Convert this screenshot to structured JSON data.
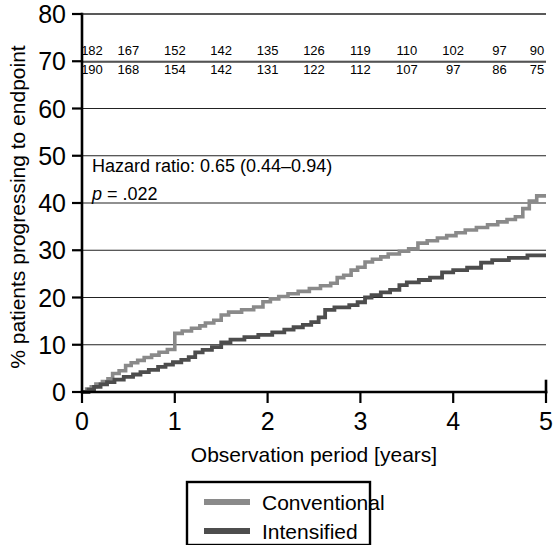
{
  "chart_data": {
    "type": "line",
    "title": "",
    "xlabel": "Observation period [years]",
    "ylabel": "% patients progressing to endpoint",
    "xlim": [
      0,
      5
    ],
    "ylim": [
      0,
      80
    ],
    "xticks": [
      "0",
      "1",
      "2",
      "3",
      "4",
      "5"
    ],
    "yticks": [
      "0",
      "10",
      "20",
      "30",
      "40",
      "50",
      "60",
      "70",
      "80"
    ],
    "grid": true,
    "legend_position": "bottom",
    "series": [
      {
        "name": "Conventional",
        "color": "#8a8a8a",
        "final_value": 42,
        "points": [
          [
            0.0,
            0.0
          ],
          [
            0.05,
            0.0
          ],
          [
            0.05,
            0.6
          ],
          [
            0.1,
            0.6
          ],
          [
            0.1,
            1.1
          ],
          [
            0.15,
            1.1
          ],
          [
            0.15,
            1.7
          ],
          [
            0.22,
            1.7
          ],
          [
            0.22,
            2.2
          ],
          [
            0.28,
            2.2
          ],
          [
            0.28,
            2.8
          ],
          [
            0.33,
            2.8
          ],
          [
            0.33,
            3.9
          ],
          [
            0.4,
            3.9
          ],
          [
            0.4,
            4.5
          ],
          [
            0.47,
            4.5
          ],
          [
            0.47,
            5.6
          ],
          [
            0.53,
            5.6
          ],
          [
            0.53,
            6.2
          ],
          [
            0.6,
            6.2
          ],
          [
            0.6,
            6.7
          ],
          [
            0.67,
            6.7
          ],
          [
            0.67,
            7.3
          ],
          [
            0.75,
            7.3
          ],
          [
            0.75,
            7.8
          ],
          [
            0.83,
            7.8
          ],
          [
            0.83,
            8.4
          ],
          [
            0.92,
            8.4
          ],
          [
            0.92,
            9.0
          ],
          [
            1.0,
            9.0
          ],
          [
            1.0,
            12.4
          ],
          [
            1.08,
            12.4
          ],
          [
            1.08,
            12.9
          ],
          [
            1.18,
            12.9
          ],
          [
            1.18,
            13.5
          ],
          [
            1.27,
            13.5
          ],
          [
            1.27,
            14.0
          ],
          [
            1.33,
            14.0
          ],
          [
            1.33,
            14.6
          ],
          [
            1.42,
            14.6
          ],
          [
            1.42,
            15.2
          ],
          [
            1.5,
            15.2
          ],
          [
            1.5,
            16.3
          ],
          [
            1.58,
            16.3
          ],
          [
            1.58,
            16.9
          ],
          [
            1.72,
            16.9
          ],
          [
            1.72,
            17.4
          ],
          [
            1.85,
            17.4
          ],
          [
            1.85,
            18.0
          ],
          [
            1.95,
            18.0
          ],
          [
            1.95,
            19.1
          ],
          [
            2.03,
            19.1
          ],
          [
            2.03,
            19.7
          ],
          [
            2.12,
            19.7
          ],
          [
            2.12,
            20.2
          ],
          [
            2.22,
            20.2
          ],
          [
            2.22,
            20.8
          ],
          [
            2.33,
            20.8
          ],
          [
            2.33,
            21.3
          ],
          [
            2.45,
            21.3
          ],
          [
            2.45,
            21.9
          ],
          [
            2.57,
            21.9
          ],
          [
            2.57,
            22.5
          ],
          [
            2.68,
            22.5
          ],
          [
            2.68,
            23.0
          ],
          [
            2.75,
            23.0
          ],
          [
            2.75,
            24.2
          ],
          [
            2.82,
            24.2
          ],
          [
            2.82,
            24.7
          ],
          [
            2.9,
            24.7
          ],
          [
            2.9,
            25.8
          ],
          [
            2.97,
            25.8
          ],
          [
            2.97,
            26.4
          ],
          [
            3.05,
            26.4
          ],
          [
            3.05,
            27.5
          ],
          [
            3.13,
            27.5
          ],
          [
            3.13,
            28.1
          ],
          [
            3.22,
            28.1
          ],
          [
            3.22,
            28.6
          ],
          [
            3.3,
            28.6
          ],
          [
            3.3,
            29.2
          ],
          [
            3.42,
            29.2
          ],
          [
            3.42,
            29.8
          ],
          [
            3.52,
            29.8
          ],
          [
            3.52,
            30.3
          ],
          [
            3.62,
            30.3
          ],
          [
            3.62,
            31.5
          ],
          [
            3.72,
            31.5
          ],
          [
            3.72,
            32.0
          ],
          [
            3.83,
            32.0
          ],
          [
            3.83,
            32.6
          ],
          [
            3.93,
            32.6
          ],
          [
            3.93,
            33.1
          ],
          [
            4.03,
            33.1
          ],
          [
            4.03,
            33.7
          ],
          [
            4.13,
            33.7
          ],
          [
            4.13,
            34.3
          ],
          [
            4.25,
            34.3
          ],
          [
            4.25,
            34.8
          ],
          [
            4.37,
            34.8
          ],
          [
            4.37,
            35.4
          ],
          [
            4.48,
            35.4
          ],
          [
            4.48,
            36.0
          ],
          [
            4.58,
            36.0
          ],
          [
            4.58,
            36.5
          ],
          [
            4.67,
            36.5
          ],
          [
            4.67,
            37.1
          ],
          [
            4.75,
            37.1
          ],
          [
            4.75,
            38.8
          ],
          [
            4.82,
            38.8
          ],
          [
            4.82,
            40.4
          ],
          [
            4.9,
            40.4
          ],
          [
            4.9,
            41.5
          ],
          [
            5.0,
            41.5
          ]
        ]
      },
      {
        "name": "Intensified",
        "color": "#4d4d4d",
        "final_value": 29,
        "points": [
          [
            0.0,
            0.0
          ],
          [
            0.07,
            0.0
          ],
          [
            0.07,
            0.5
          ],
          [
            0.13,
            0.5
          ],
          [
            0.13,
            1.1
          ],
          [
            0.2,
            1.1
          ],
          [
            0.2,
            1.6
          ],
          [
            0.27,
            1.6
          ],
          [
            0.27,
            2.1
          ],
          [
            0.35,
            2.1
          ],
          [
            0.35,
            2.6
          ],
          [
            0.45,
            2.6
          ],
          [
            0.45,
            3.2
          ],
          [
            0.55,
            3.2
          ],
          [
            0.55,
            3.7
          ],
          [
            0.63,
            3.7
          ],
          [
            0.63,
            4.2
          ],
          [
            0.72,
            4.2
          ],
          [
            0.72,
            4.7
          ],
          [
            0.82,
            4.7
          ],
          [
            0.82,
            5.3
          ],
          [
            0.9,
            5.3
          ],
          [
            0.9,
            5.8
          ],
          [
            0.98,
            5.8
          ],
          [
            0.98,
            6.3
          ],
          [
            1.07,
            6.3
          ],
          [
            1.07,
            6.8
          ],
          [
            1.15,
            6.8
          ],
          [
            1.15,
            7.4
          ],
          [
            1.22,
            7.4
          ],
          [
            1.22,
            8.4
          ],
          [
            1.3,
            8.4
          ],
          [
            1.3,
            8.9
          ],
          [
            1.4,
            8.9
          ],
          [
            1.4,
            9.5
          ],
          [
            1.5,
            9.5
          ],
          [
            1.5,
            10.5
          ],
          [
            1.6,
            10.5
          ],
          [
            1.6,
            11.1
          ],
          [
            1.75,
            11.1
          ],
          [
            1.75,
            11.6
          ],
          [
            1.9,
            11.6
          ],
          [
            1.9,
            12.1
          ],
          [
            2.05,
            12.1
          ],
          [
            2.05,
            12.6
          ],
          [
            2.18,
            12.6
          ],
          [
            2.18,
            13.2
          ],
          [
            2.28,
            13.2
          ],
          [
            2.28,
            13.7
          ],
          [
            2.38,
            13.7
          ],
          [
            2.38,
            14.2
          ],
          [
            2.47,
            14.2
          ],
          [
            2.47,
            14.8
          ],
          [
            2.55,
            14.8
          ],
          [
            2.55,
            15.8
          ],
          [
            2.62,
            15.8
          ],
          [
            2.62,
            17.4
          ],
          [
            2.72,
            17.4
          ],
          [
            2.72,
            17.9
          ],
          [
            2.88,
            17.9
          ],
          [
            2.88,
            18.4
          ],
          [
            2.97,
            18.4
          ],
          [
            2.97,
            19.0
          ],
          [
            3.05,
            19.0
          ],
          [
            3.05,
            20.0
          ],
          [
            3.12,
            20.0
          ],
          [
            3.12,
            20.5
          ],
          [
            3.22,
            20.5
          ],
          [
            3.22,
            21.1
          ],
          [
            3.32,
            21.1
          ],
          [
            3.32,
            21.6
          ],
          [
            3.42,
            21.6
          ],
          [
            3.42,
            22.6
          ],
          [
            3.5,
            22.6
          ],
          [
            3.5,
            23.2
          ],
          [
            3.63,
            23.2
          ],
          [
            3.63,
            23.7
          ],
          [
            3.75,
            23.7
          ],
          [
            3.75,
            24.2
          ],
          [
            3.88,
            24.2
          ],
          [
            3.88,
            25.3
          ],
          [
            4.0,
            25.3
          ],
          [
            4.0,
            25.8
          ],
          [
            4.15,
            25.8
          ],
          [
            4.15,
            26.3
          ],
          [
            4.3,
            26.3
          ],
          [
            4.3,
            27.4
          ],
          [
            4.42,
            27.4
          ],
          [
            4.42,
            27.9
          ],
          [
            4.6,
            27.9
          ],
          [
            4.6,
            28.4
          ],
          [
            4.8,
            28.4
          ],
          [
            4.8,
            28.9
          ],
          [
            5.0,
            28.9
          ]
        ]
      }
    ],
    "annotation": {
      "hazard_ratio_line": "Hazard ratio: 0.65 (0.44–0.94)",
      "p_value_italic": "p",
      "p_value_rest": " = .022"
    },
    "risk_table": {
      "x_positions": [
        "0",
        "0.5",
        "1",
        "1.5",
        "2",
        "2.5",
        "3",
        "3.5",
        "4",
        "4.5",
        "5"
      ],
      "rows": [
        {
          "series": "Conventional",
          "counts": [
            "182",
            "167",
            "152",
            "142",
            "135",
            "126",
            "119",
            "110",
            "102",
            "97",
            "90"
          ]
        },
        {
          "series": "Intensified",
          "counts": [
            "190",
            "168",
            "154",
            "142",
            "131",
            "122",
            "112",
            "107",
            "97",
            "86",
            "75"
          ]
        }
      ]
    },
    "legend": [
      {
        "label": "Conventional",
        "color": "#8a8a8a"
      },
      {
        "label": "Intensified",
        "color": "#4d4d4d"
      }
    ]
  }
}
